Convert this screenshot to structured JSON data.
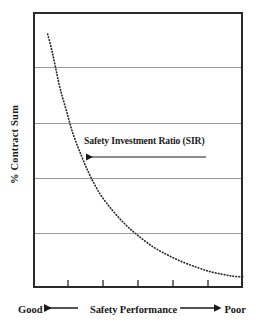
{
  "chart_data": {
    "type": "line",
    "title": "",
    "subtitle": "",
    "xlabel": "Safety Performance",
    "ylabel": "% Contract Sum",
    "xlabel_left": "Good",
    "xlabel_right": "Poor",
    "xlim": [
      0,
      100
    ],
    "ylim": [
      0,
      100
    ],
    "grid": true,
    "gridlines_y": [
      20,
      40,
      60,
      80
    ],
    "x_ticks": [
      16.7,
      33.3,
      50,
      66.7,
      83.3
    ],
    "x_tick_labels": [
      "",
      "",
      "",
      "",
      ""
    ],
    "y_tick_labels": [],
    "legend_position": "none",
    "line_style": "dotted",
    "line_color": "#2b2b2b",
    "series": [
      {
        "name": "Safety Investment Ratio (SIR)",
        "x": [
          7,
          9,
          11,
          13,
          16,
          19,
          23,
          27,
          32,
          38,
          44,
          50,
          57,
          64,
          71,
          78,
          84,
          90,
          95,
          100
        ],
        "y": [
          92,
          86,
          79,
          72,
          64,
          56,
          48,
          41,
          34,
          28,
          23,
          19,
          15,
          12,
          9.5,
          7.5,
          6,
          5,
          4.3,
          4
        ]
      }
    ],
    "annotations": [
      {
        "text": "Safety Investment Ratio (SIR)",
        "arrow": "left",
        "x": 25,
        "y": 53
      }
    ]
  },
  "axes": {
    "y_label": "% Contract Sum",
    "x_caption_left": "Good",
    "x_caption_middle": "Safety Performance",
    "x_caption_right": "Poor",
    "arrow_left_glyph": "left-arrow-icon",
    "arrow_right_glyph": "right-arrow-icon"
  },
  "annotation": {
    "label": "Safety Investment Ratio (SIR)",
    "arrow_direction": "left"
  },
  "colors": {
    "border": "#2b2b2b",
    "gridline": "#9a9a9a",
    "curve": "#2b2b2b",
    "text": "#1a1a1a",
    "background": "#ffffff"
  }
}
